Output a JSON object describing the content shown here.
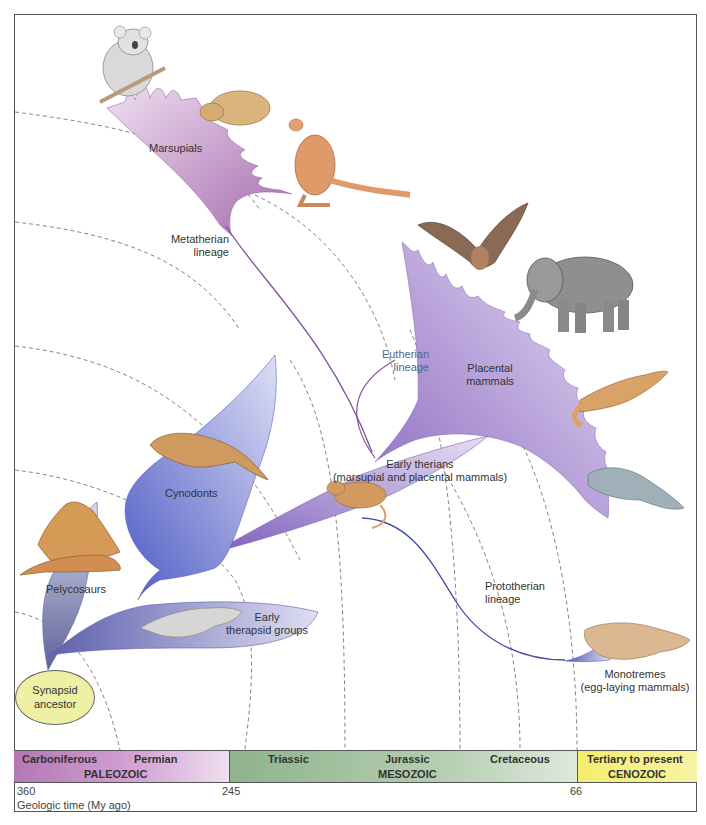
{
  "figure": {
    "groups": [
      {
        "id": "synapsid",
        "label_lines": [
          "Synapsid",
          "ancestor"
        ]
      },
      {
        "id": "pelycosaurs",
        "label": "Pelycosaurs"
      },
      {
        "id": "early_therapsids",
        "label_lines": [
          "Early",
          "therapsid groups"
        ]
      },
      {
        "id": "cynodonts",
        "label": "Cynodonts"
      },
      {
        "id": "early_therians",
        "label_lines": [
          "Early therians",
          "(marsupial and placental mammals)"
        ]
      },
      {
        "id": "marsupials",
        "label": "Marsupials"
      },
      {
        "id": "placentals",
        "label_lines": [
          "Placental",
          "mammals"
        ]
      },
      {
        "id": "monotremes",
        "label_lines": [
          "Monotremes",
          "(egg-laying mammals)"
        ]
      }
    ],
    "lineages": [
      {
        "id": "metatherian",
        "label_lines": [
          "Metatherian",
          "lineage"
        ]
      },
      {
        "id": "eutherian",
        "label_lines": [
          "Eutherian",
          "lineage"
        ]
      },
      {
        "id": "prototherian",
        "label_lines": [
          "Prototherian",
          "lineage"
        ]
      }
    ],
    "animals": [
      "koala",
      "wombat",
      "kangaroo",
      "bat",
      "elephant",
      "ferret",
      "manatee",
      "early-therian-shrew",
      "cynodont",
      "dimetrodon",
      "therapsid",
      "platypus"
    ]
  },
  "timeline": {
    "eras": [
      {
        "name": "PALEOZOIC",
        "periods": [
          "Carboniferous",
          "Permian"
        ],
        "color": "#c190c3"
      },
      {
        "name": "MESOZOIC",
        "periods": [
          "Triassic",
          "Jurassic",
          "Cretaceous"
        ],
        "color": "#a9c6a6"
      },
      {
        "name": "CENOZOIC",
        "periods": [
          "Tertiary to present"
        ],
        "color": "#f5f08a"
      }
    ],
    "ticks": [
      "360",
      "245",
      "66"
    ],
    "axis_label": "Geologic time (My ago)"
  },
  "colors": {
    "marsupial_fill": "#b985c0",
    "placental_fill": "#a88ad0",
    "cynodont_fill": "#6f78cf",
    "therapsid_fill": "#7d7fc0",
    "ancestor_fill": "#eef0a4"
  }
}
